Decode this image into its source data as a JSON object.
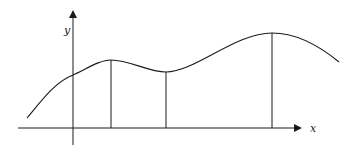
{
  "diagram": {
    "type": "function-graph",
    "labels": {
      "x_axis": "x",
      "y_axis": "y"
    },
    "colors": {
      "stroke": "#1a1a1a",
      "background": "#ffffff"
    },
    "axes": {
      "x_axis": {
        "x1": 18,
        "x2": 300,
        "y": 128
      },
      "y_axis": {
        "x": 73,
        "y1": 145,
        "y2": 12
      }
    },
    "curve_path": "M 27 118 C 42 100, 55 82, 73 75 C 88 68, 100 60, 111 60 C 130 60, 148 72, 166 72 C 195 72, 235 33, 272 33 C 298 33, 322 48, 339 62",
    "vertical_lines": [
      {
        "x": 111,
        "y_top": 60,
        "y_bottom": 128
      },
      {
        "x": 166,
        "y_top": 72,
        "y_bottom": 128
      },
      {
        "x": 272,
        "y_top": 33,
        "y_bottom": 128
      }
    ]
  }
}
